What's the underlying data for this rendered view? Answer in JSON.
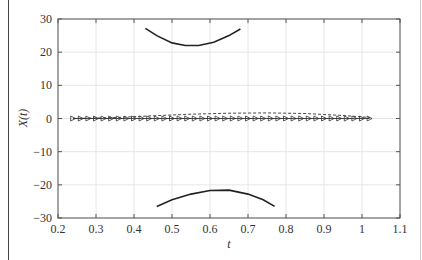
{
  "chart_data": {
    "type": "line",
    "title": "",
    "xlabel": "t",
    "ylabel": "X(t)",
    "xlim": [
      0.2,
      1.1
    ],
    "ylim": [
      -30,
      30
    ],
    "xticks": [
      0.2,
      0.3,
      0.4,
      0.5,
      0.6,
      0.7,
      0.8,
      0.9,
      1,
      1.1
    ],
    "xtick_labels": [
      "0.2",
      "0.3",
      "0.4",
      "0.5",
      "0.6",
      "0.7",
      "0.8",
      "0.9",
      "1",
      "1.1"
    ],
    "yticks": [
      -30,
      -20,
      -10,
      0,
      10,
      20,
      30
    ],
    "ytick_labels": [
      "−30",
      "−20",
      "−10",
      "0",
      "10",
      "20",
      "30"
    ],
    "grid": true,
    "legend": null,
    "series": [
      {
        "name": "upper branch",
        "style": "solid",
        "color": "#222222",
        "x": [
          0.43,
          0.46,
          0.5,
          0.535,
          0.57,
          0.61,
          0.65,
          0.68
        ],
        "y": [
          27.2,
          25.0,
          22.8,
          22.0,
          22.0,
          23.0,
          25.0,
          27.0
        ]
      },
      {
        "name": "lower branch",
        "style": "solid",
        "color": "#222222",
        "x": [
          0.46,
          0.5,
          0.55,
          0.6,
          0.65,
          0.7,
          0.74,
          0.77
        ],
        "y": [
          -26.5,
          -24.5,
          -22.8,
          -21.7,
          -21.6,
          -22.8,
          -24.5,
          -26.5
        ]
      },
      {
        "name": "dashed near-zero curve",
        "style": "dashed",
        "color": "#333333",
        "x": [
          0.24,
          0.35,
          0.45,
          0.55,
          0.65,
          0.75,
          0.85,
          0.95,
          1.02
        ],
        "y": [
          0.0,
          0.3,
          0.8,
          1.3,
          1.6,
          1.7,
          1.5,
          0.9,
          0.3
        ]
      },
      {
        "name": "triangle-marker series",
        "style": "solid-with-right-triangle-markers",
        "color": "#333333",
        "x": [
          0.24,
          0.26,
          0.28,
          0.3,
          0.32,
          0.34,
          0.36,
          0.38,
          0.4,
          0.42,
          0.44,
          0.46,
          0.48,
          0.5,
          0.52,
          0.54,
          0.56,
          0.58,
          0.6,
          0.62,
          0.64,
          0.66,
          0.68,
          0.7,
          0.72,
          0.74,
          0.76,
          0.78,
          0.8,
          0.82,
          0.84,
          0.86,
          0.88,
          0.9,
          0.92,
          0.94,
          0.96,
          0.98,
          1.0,
          1.02
        ],
        "y": [
          0,
          0,
          0,
          0,
          0,
          0,
          0,
          0,
          0,
          0,
          0,
          0,
          0,
          0,
          0,
          0,
          0,
          0,
          0,
          0,
          0,
          0,
          0,
          0,
          0,
          0,
          0,
          0,
          0,
          0,
          0,
          0,
          0,
          0,
          0,
          0,
          0,
          0,
          0,
          0
        ]
      }
    ]
  }
}
